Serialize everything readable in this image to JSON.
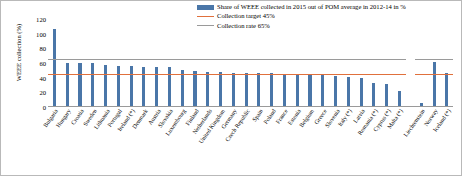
{
  "chart_data": {
    "type": "bar",
    "title": "",
    "xlabel": "",
    "ylabel": "WEEE collection (%)",
    "ylim": [
      0,
      120
    ],
    "yticks": [
      0,
      20,
      40,
      60,
      80,
      100,
      120
    ],
    "grid": false,
    "legend_position": "top-right",
    "legend": [
      {
        "label": "Share of WEEE collected in 2015 out of POM average in 2012-14 in %",
        "type": "bar",
        "color": "#4a76a8"
      },
      {
        "label": "Collection target 45%",
        "type": "line",
        "color": "#e0703c"
      },
      {
        "label": "Collection rate 65%",
        "type": "line",
        "color": "#9a9a9a"
      }
    ],
    "reference_lines": [
      {
        "name": "collection-target",
        "value": 45,
        "color": "#e0703c"
      },
      {
        "name": "collection-rate",
        "value": 65,
        "color": "#9a9a9a"
      }
    ],
    "categories": [
      "Bulgaria",
      "Hungary",
      "Croatia",
      "Sweden",
      "Lithuania",
      "Portugal",
      "Ireland (*)",
      "Denmark",
      "Austria",
      "Slovakia",
      "Luxembourg",
      "Finland",
      "Netherlands",
      "United Kingdom",
      "Germany",
      "Czech Republic",
      "Spain",
      "Poland",
      "France",
      "Estonia",
      "Belgium",
      "Greece",
      "Slovenia",
      "Italy (*)",
      "Latvia",
      "Romania (*)",
      "Cyprus (*)",
      "Malta (*)",
      "Liechtenstein",
      "Norway",
      "Iceland (*)"
    ],
    "values": [
      107,
      60,
      60,
      60,
      57,
      56,
      56,
      55,
      54,
      54,
      50,
      49,
      48,
      48,
      47,
      47,
      46,
      46,
      45,
      45,
      44,
      43,
      42,
      41,
      40,
      33,
      31,
      22,
      5,
      62,
      46
    ],
    "groups": [
      {
        "name": "EU Member States",
        "from": "Bulgaria",
        "to": "Malta (*)"
      },
      {
        "name": "EEA/EFTA",
        "from": "Liechtenstein",
        "to": "Iceland (*)"
      }
    ],
    "footnote_marker": "(*)"
  }
}
